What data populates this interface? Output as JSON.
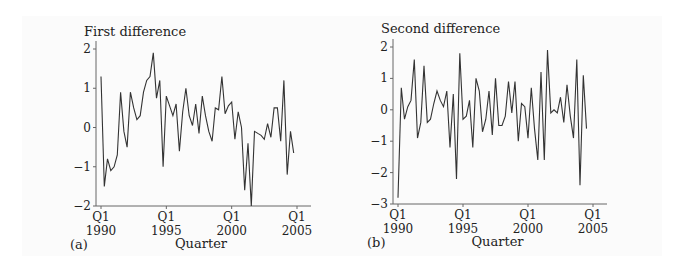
{
  "chart_data": [
    {
      "panel_label": "(a)",
      "type": "line",
      "title": "First difference",
      "xlabel": "Quarter",
      "ylabel": "",
      "ylim": [
        -2,
        2
      ],
      "yticks": [
        2,
        1,
        0,
        -1,
        -2
      ],
      "xticks": [
        {
          "label_top": "Q1",
          "label_bottom": "1990",
          "index": 0
        },
        {
          "label_top": "Q1",
          "label_bottom": "1995",
          "index": 20
        },
        {
          "label_top": "Q1",
          "label_bottom": "2000",
          "index": 40
        },
        {
          "label_top": "Q1",
          "label_bottom": "2005",
          "index": 60
        }
      ],
      "grid": false,
      "start_index": 0,
      "values": [
        1.3,
        -1.5,
        -0.8,
        -1.1,
        -1.0,
        -0.7,
        0.9,
        -0.1,
        -0.5,
        0.9,
        0.5,
        0.2,
        0.3,
        0.9,
        1.2,
        1.3,
        1.9,
        0.75,
        1.2,
        -1.0,
        0.8,
        0.55,
        0.3,
        0.6,
        -0.6,
        0.4,
        1.0,
        0.3,
        0.05,
        0.6,
        -0.15,
        0.8,
        0.3,
        -0.1,
        -0.35,
        0.5,
        0.45,
        1.3,
        0.35,
        0.55,
        0.65,
        -0.3,
        0.4,
        0.0,
        -1.6,
        -0.4,
        -2.0,
        -0.1,
        -0.15,
        -0.2,
        -0.3,
        0.1,
        -0.25,
        0.5,
        0.5,
        -0.35,
        1.2,
        -1.2,
        -0.1,
        -0.65
      ]
    },
    {
      "panel_label": "(b)",
      "type": "line",
      "title": "Second difference",
      "xlabel": "Quarter",
      "ylabel": "",
      "ylim": [
        -3,
        2
      ],
      "yticks": [
        2,
        1,
        0,
        -1,
        -2,
        -3
      ],
      "xticks": [
        {
          "label_top": "Q1",
          "label_bottom": "1990",
          "index": 0
        },
        {
          "label_top": "Q1",
          "label_bottom": "1995",
          "index": 20
        },
        {
          "label_top": "Q1",
          "label_bottom": "2000",
          "index": 40
        },
        {
          "label_top": "Q1",
          "label_bottom": "2005",
          "index": 60
        }
      ],
      "grid": false,
      "start_index": 0,
      "values": [
        -2.8,
        0.7,
        -0.3,
        0.1,
        0.3,
        1.6,
        -0.9,
        -0.4,
        1.4,
        -0.4,
        -0.3,
        0.2,
        0.6,
        0.3,
        0.1,
        0.6,
        -1.2,
        0.5,
        -2.2,
        1.8,
        -0.3,
        -0.2,
        0.3,
        -1.2,
        1.0,
        0.6,
        -0.7,
        -0.3,
        0.6,
        -0.8,
        1.0,
        -0.5,
        -0.5,
        -0.2,
        0.9,
        -0.1,
        0.9,
        -1.0,
        0.2,
        0.1,
        -0.9,
        0.7,
        -0.6,
        -1.6,
        1.2,
        -1.6,
        1.9,
        -0.1,
        0.0,
        -0.1,
        0.4,
        -0.4,
        0.8,
        -0.2,
        -0.9,
        1.6,
        -2.4,
        1.1,
        -0.6
      ]
    }
  ]
}
